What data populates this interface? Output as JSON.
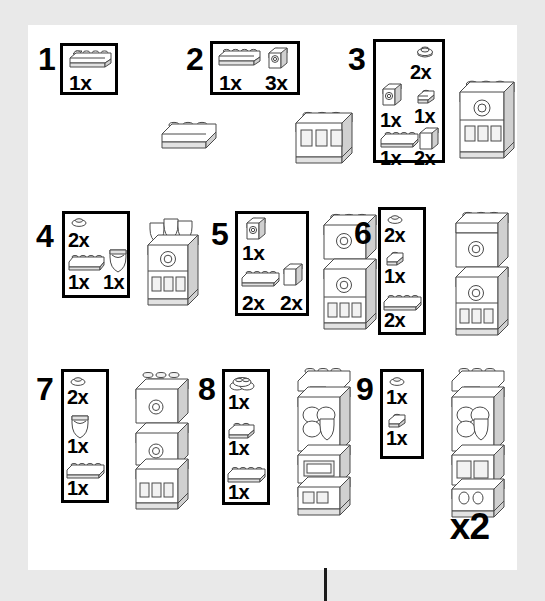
{
  "page": {
    "repeat_label": "x2",
    "background_color": "#e9e9e9",
    "paper_color": "#ffffff",
    "ink_color": "#000000"
  },
  "steps": [
    {
      "number": "1",
      "parts": [
        {
          "icon": "plate-1x4",
          "qty": "1x"
        }
      ],
      "model": "plate-1x3"
    },
    {
      "number": "2",
      "parts": [
        {
          "icon": "plate-1x4",
          "qty": "1x"
        },
        {
          "icon": "brick-1x1-window",
          "qty": "3x"
        }
      ],
      "model": "wall-3-windows"
    },
    {
      "number": "3",
      "parts": [
        {
          "icon": "round-plate-1x1",
          "qty": "2x"
        },
        {
          "icon": "plate-1x1",
          "qty": "1x"
        },
        {
          "icon": "brick-1x1-window",
          "qty": "1x"
        },
        {
          "icon": "brick-1x2",
          "qty": "2x"
        },
        {
          "icon": "plate-1x4",
          "qty": "1x"
        }
      ],
      "model": "wall-windows-arch"
    },
    {
      "number": "4",
      "parts": [
        {
          "icon": "round-plate-1x1",
          "qty": "2x"
        },
        {
          "icon": "plate-1x4",
          "qty": "1x"
        },
        {
          "icon": "shield",
          "qty": "1x"
        }
      ],
      "model": "wall-shield-stack"
    },
    {
      "number": "5",
      "parts": [
        {
          "icon": "brick-1x1-window",
          "qty": "1x"
        },
        {
          "icon": "plate-1x4",
          "qty": "2x"
        },
        {
          "icon": "brick-1x2",
          "qty": "2x"
        }
      ],
      "model": "tower-2-levels"
    },
    {
      "number": "6",
      "parts": [
        {
          "icon": "round-plate-1x1",
          "qty": "2x"
        },
        {
          "icon": "plate-1x1",
          "qty": "1x"
        },
        {
          "icon": "plate-1x4",
          "qty": "2x"
        }
      ],
      "model": "tower-3-levels"
    },
    {
      "number": "7",
      "parts": [
        {
          "icon": "round-plate-1x1",
          "qty": "2x"
        },
        {
          "icon": "shield",
          "qty": "1x"
        },
        {
          "icon": "plate-1x4",
          "qty": "1x"
        }
      ],
      "model": "tower-4-levels"
    },
    {
      "number": "8",
      "parts": [
        {
          "icon": "round-brick-cluster",
          "qty": "1x"
        },
        {
          "icon": "plate-1x2",
          "qty": "1x"
        },
        {
          "icon": "plate-1x4",
          "qty": "1x"
        }
      ],
      "model": "tower-ornate"
    },
    {
      "number": "9",
      "parts": [
        {
          "icon": "round-plate-1x1",
          "qty": "1x"
        },
        {
          "icon": "plate-1x1",
          "qty": "1x"
        }
      ],
      "model": "tower-complete"
    }
  ]
}
